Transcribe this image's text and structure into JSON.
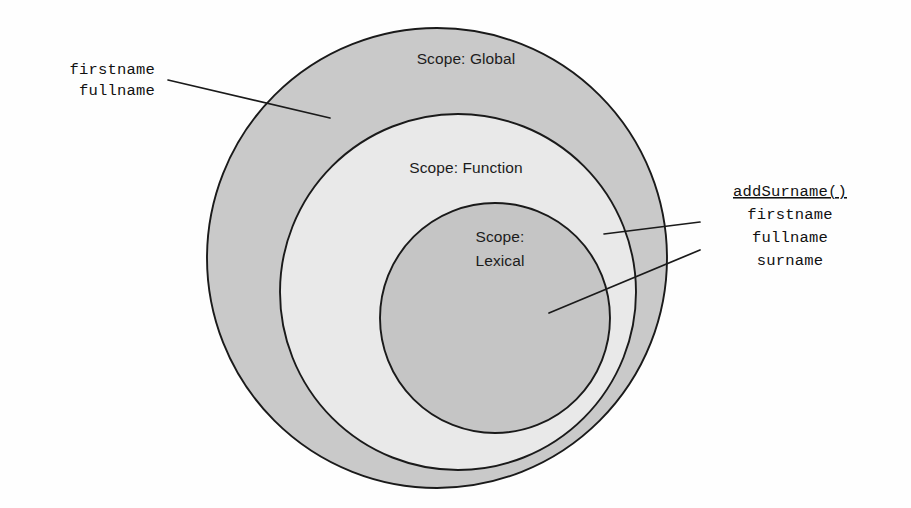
{
  "diagram": {
    "background_color": "#fefefe",
    "outline_color": "#1a1a1a",
    "circles": [
      {
        "id": "global",
        "label": "Scope: Global",
        "label_lines": [
          "Scope: Global"
        ],
        "fill_color": "#c9c9c9",
        "cx": 437,
        "cy": 258,
        "r": 230,
        "label_x": 466,
        "label_y": 60
      },
      {
        "id": "function",
        "label": "Scope: Function",
        "label_lines": [
          "Scope: Function"
        ],
        "fill_color": "#e9e9e9",
        "cx": 458,
        "cy": 292,
        "r": 178,
        "label_x": 466,
        "label_y": 169
      },
      {
        "id": "lexical",
        "label": "Scope: Lexical",
        "label_lines": [
          "Scope:",
          "Lexical"
        ],
        "fill_color": "#c5c5c5",
        "cx": 495,
        "cy": 318,
        "r": 115,
        "label_x": 500,
        "label_y": 238
      }
    ],
    "annotations": [
      {
        "id": "global-vars",
        "align": "left",
        "anchor_x": 155,
        "first_line_y": 74,
        "line_height": 21,
        "lines": [
          {
            "text": "firstname",
            "underline": false
          },
          {
            "text": "fullname",
            "underline": false
          }
        ],
        "leader": {
          "x1": 168,
          "y1": 80,
          "x2": 330,
          "y2": 118
        }
      },
      {
        "id": "function-vars",
        "align": "right",
        "anchor_x": 790,
        "first_line_y": 196,
        "line_height": 23,
        "lines": [
          {
            "text": "addSurname()",
            "underline": true
          },
          {
            "text": "firstname",
            "underline": false
          },
          {
            "text": "fullname",
            "underline": false
          },
          {
            "text": "surname",
            "underline": false
          }
        ],
        "leader": {
          "x1": 700,
          "y1": 222,
          "x2": 604,
          "y2": 234
        }
      },
      {
        "id": "lexical-vars-leader",
        "align": "right",
        "leader": {
          "x1": 700,
          "y1": 250,
          "x2": 549,
          "y2": 313
        }
      }
    ]
  }
}
